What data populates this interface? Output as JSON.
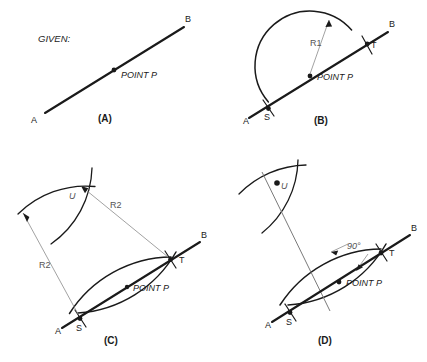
{
  "figure": {
    "title_label": "GIVEN:"
  },
  "labels": {
    "point_a": "A",
    "point_b": "B",
    "point_s": "S",
    "point_t": "T",
    "point_u": "U",
    "point_p": "POINT P",
    "radius_1": "R1",
    "radius_2": "R2",
    "angle_90": "90°"
  },
  "panels": [
    {
      "id": "a",
      "caption": "(A)",
      "given_label": "GIVEN:",
      "labels": {
        "a": "A",
        "b": "B",
        "p": "POINT P"
      }
    },
    {
      "id": "b",
      "caption": "(B)",
      "labels": {
        "a": "A",
        "b": "B",
        "s": "S",
        "t": "T",
        "p": "POINT P",
        "radius": "R1"
      }
    },
    {
      "id": "c",
      "caption": "(C)",
      "labels": {
        "a": "A",
        "b": "B",
        "s": "S",
        "t": "T",
        "u": "U",
        "p": "POINT P",
        "radius_left": "R2",
        "radius_right": "R2"
      }
    },
    {
      "id": "d",
      "caption": "(D)",
      "labels": {
        "a": "A",
        "b": "B",
        "s": "S",
        "t": "T",
        "u": "U",
        "p": "POINT P",
        "angle": "90°"
      }
    }
  ],
  "colors": {
    "ink": "#1a1a1a",
    "dimension": "#8a8a8a",
    "background": "#ffffff"
  }
}
